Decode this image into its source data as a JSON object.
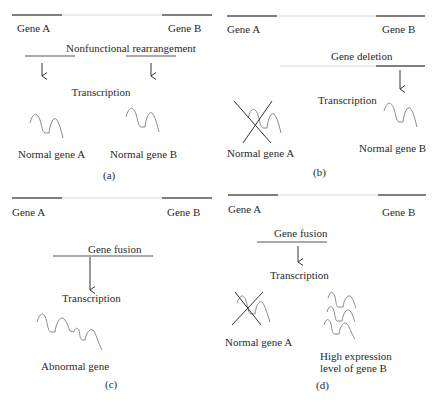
{
  "colors": {
    "gene_segment": "#555555",
    "spacer_line": "#d0d0d0",
    "text": "#2a2a2a",
    "mrna_wave": "#8a8a8a",
    "cross": "#333333"
  },
  "panels": [
    {
      "id": "a",
      "gene_a": "Gene A",
      "gene_b": "Gene B",
      "event": "Nonfunctional rearrangement",
      "process": "Transcription",
      "product_a": "Normal gene A",
      "product_b": "Normal gene B",
      "label": "(a)"
    },
    {
      "id": "b",
      "gene_a": "Gene A",
      "gene_b": "Gene B",
      "event": "Gene deletion",
      "process": "Transcription",
      "product_a": "Normal gene A",
      "product_b": "Normal gene B",
      "label": "(b)"
    },
    {
      "id": "c",
      "gene_a": "Gene A",
      "gene_b": "Gene B",
      "event": "Gene fusion",
      "process": "Transcription",
      "product": "Abnormal gene",
      "label": "(c)"
    },
    {
      "id": "d",
      "gene_a": "Gene A",
      "gene_b": "Gene B",
      "event": "Gene fusion",
      "process": "Transcription",
      "product_a": "Normal gene A",
      "product_b_line1": "High expression",
      "product_b_line2": "level of gene B",
      "label": "(d)"
    }
  ]
}
